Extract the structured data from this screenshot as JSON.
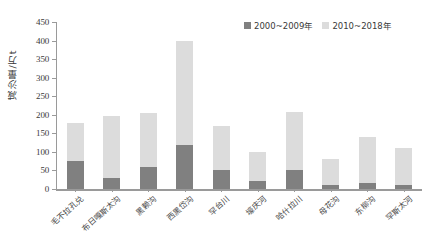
{
  "chart_data": {
    "type": "bar",
    "subtype": "stacked-bar",
    "title": "",
    "xlabel": "",
    "ylabel": "减沙量/万t",
    "ylim": [
      0,
      450
    ],
    "ytick_step": 50,
    "yticks": [
      0,
      50,
      100,
      150,
      200,
      250,
      300,
      350,
      400,
      450
    ],
    "ytick_labels": [
      "0",
      "50",
      "100",
      "150",
      "200",
      "250",
      "300",
      "350",
      "400",
      "450"
    ],
    "grid": false,
    "legend_position": "top-right",
    "categories": [
      "毛不拉孔兑",
      "布日嘎斯太沟",
      "黑赖沟",
      "西黑岱沟",
      "罕台川",
      "壕庆河",
      "哈什拉川",
      "母花沟",
      "东柳沟",
      "罕斯太河"
    ],
    "series": [
      {
        "name": "2000~2009年",
        "color": "#808080",
        "values": [
          75,
          30,
          58,
          118,
          52,
          22,
          52,
          12,
          15,
          12
        ]
      },
      {
        "name": "2010~2018年",
        "color": "#dcdcdc",
        "values": [
          103,
          168,
          147,
          282,
          118,
          78,
          156,
          70,
          125,
          98
        ]
      }
    ],
    "totals": [
      178,
      198,
      205,
      400,
      170,
      100,
      208,
      82,
      140,
      110
    ]
  },
  "legend": {
    "items": [
      {
        "label": "2000~2009年",
        "color": "#808080"
      },
      {
        "label": "2010~2018年",
        "color": "#dcdcdc"
      }
    ]
  },
  "axis": {
    "y_title": "减沙量/万t"
  },
  "colors": {
    "series_early": "#808080",
    "series_late": "#dcdcdc",
    "axis": "#9a9a9a",
    "text": "#3a3a3a",
    "background": "#ffffff"
  }
}
